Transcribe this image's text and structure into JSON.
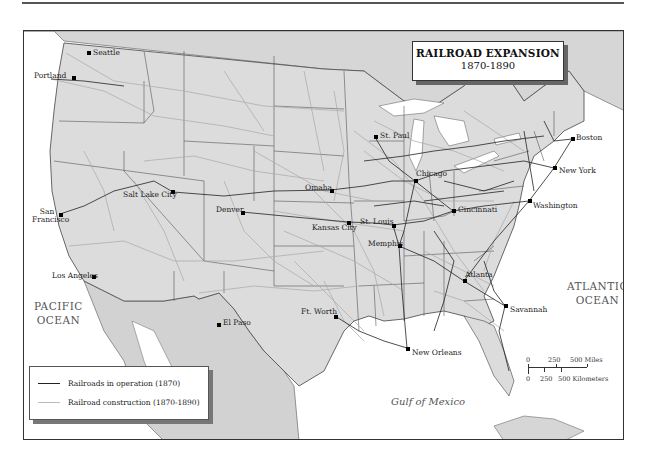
{
  "title": {
    "line1": "RAILROAD EXPANSION",
    "line2": "1870-1890"
  },
  "colors": {
    "land": "#dcdcdc",
    "water": "#ffffff",
    "mexico_canada": "#d4d4d4",
    "rail_1870": "#222222",
    "rail_construction": "#a8a8a8",
    "border": "#333333"
  },
  "water_labels": {
    "pacific": [
      "PACIFIC",
      "OCEAN"
    ],
    "atlantic": [
      "ATLANTIC",
      "OCEAN"
    ],
    "gulf": "Gulf of Mexico"
  },
  "cities": [
    {
      "name": "Seattle",
      "x": 63,
      "y": 22
    },
    {
      "name": "Portland",
      "x": 50,
      "y": 46
    },
    {
      "name": "San Francisco",
      "x": 36,
      "y": 183
    },
    {
      "name": "Salt Lake City",
      "x": 149,
      "y": 161
    },
    {
      "name": "Los Angeles",
      "x": 70,
      "y": 244
    },
    {
      "name": "Denver",
      "x": 218,
      "y": 181
    },
    {
      "name": "El Paso",
      "x": 195,
      "y": 293
    },
    {
      "name": "Omaha",
      "x": 307,
      "y": 159
    },
    {
      "name": "Kansas City",
      "x": 324,
      "y": 191
    },
    {
      "name": "St. Paul",
      "x": 351,
      "y": 106
    },
    {
      "name": "St. Louis",
      "x": 369,
      "y": 194
    },
    {
      "name": "Chicago",
      "x": 391,
      "y": 150
    },
    {
      "name": "Cincinnati",
      "x": 429,
      "y": 180
    },
    {
      "name": "Ft. Worth",
      "x": 311,
      "y": 285
    },
    {
      "name": "Memphis",
      "x": 375,
      "y": 215
    },
    {
      "name": "Atlanta",
      "x": 440,
      "y": 250
    },
    {
      "name": "Savannah",
      "x": 481,
      "y": 275
    },
    {
      "name": "New Orleans",
      "x": 383,
      "y": 317
    },
    {
      "name": "Washington",
      "x": 505,
      "y": 170
    },
    {
      "name": "New York",
      "x": 530,
      "y": 137
    },
    {
      "name": "Boston",
      "x": 548,
      "y": 108
    }
  ],
  "legend": {
    "items": [
      {
        "label": "Railroads in operation (1870)",
        "style": "dark"
      },
      {
        "label": "Railroad construction (1870-1890)",
        "style": "light"
      }
    ]
  },
  "scale": {
    "miles": [
      "0",
      "250",
      "500 Miles"
    ],
    "kilometers": [
      "0",
      "250",
      "500 Kilometers"
    ]
  }
}
